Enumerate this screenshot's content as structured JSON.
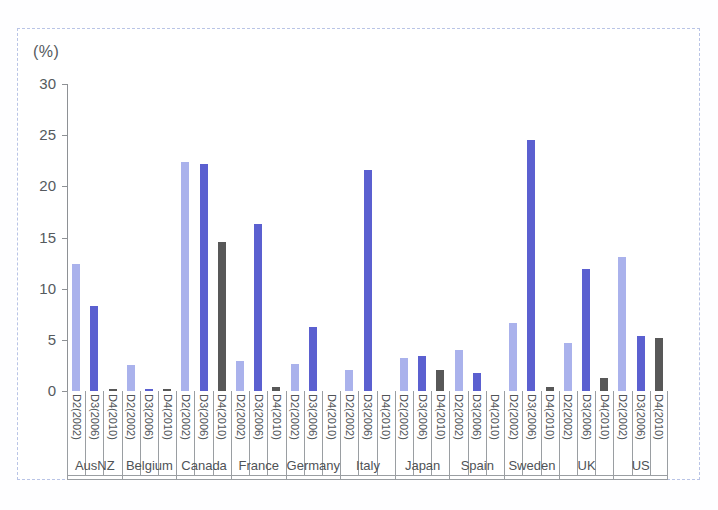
{
  "chart_data": {
    "type": "bar",
    "title": "",
    "subtitle": "",
    "xlabel": "",
    "ylabel": "",
    "unit_label": "(%)",
    "ylim": [
      0,
      30
    ],
    "ytick_labels": [
      "0",
      "5",
      "10",
      "15",
      "20",
      "25",
      "30"
    ],
    "ytick_values": [
      0,
      5,
      10,
      15,
      20,
      25,
      30
    ],
    "grid": false,
    "legend_position": "none",
    "categories": [
      "AusNZ",
      "Belgium",
      "Canada",
      "France",
      "Germany",
      "Italy",
      "Japan",
      "Spain",
      "Sweden",
      "UK",
      "US"
    ],
    "subcategories": [
      "D2(2002)",
      "D3(2006)",
      "D4(2010)"
    ],
    "series": [
      {
        "name": "D2(2002)",
        "color": "#aab2ec",
        "values": [
          12.4,
          2.5,
          22.4,
          2.9,
          2.6,
          2.1,
          3.2,
          4.0,
          6.6,
          4.7,
          13.1
        ]
      },
      {
        "name": "D3(2006)",
        "color": "#5b60d0",
        "values": [
          8.3,
          0.2,
          22.2,
          16.3,
          6.3,
          21.6,
          3.4,
          1.8,
          24.5,
          11.9,
          5.4
        ]
      },
      {
        "name": "D4(2010)",
        "color": "#585858",
        "values": [
          0.2,
          0.2,
          14.6,
          0.4,
          0.0,
          0.0,
          2.1,
          0.0,
          0.4,
          1.3,
          5.2
        ]
      }
    ],
    "colors": {
      "d2": "#aab2ec",
      "d3": "#5b60d0",
      "d4": "#585858",
      "axis": "#8e9195",
      "frame": "#b9c4e6",
      "text": "#4f5357"
    }
  }
}
